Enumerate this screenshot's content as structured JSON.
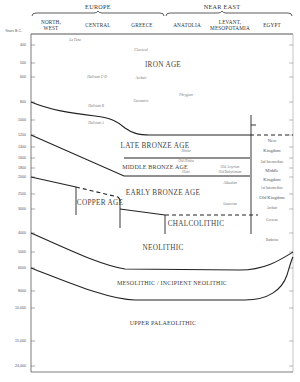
{
  "header": {
    "regions": [
      {
        "label": "EUROPE",
        "x": 98
      },
      {
        "label": "NEAR EAST",
        "x": 222
      }
    ],
    "columns": [
      {
        "label_line1": "NORTH,",
        "label_line2": "WEST",
        "x": 51
      },
      {
        "label_line1": "CENTRAL",
        "label_line2": "",
        "x": 98
      },
      {
        "label_line1": "GREECE",
        "label_line2": "",
        "x": 142
      },
      {
        "label_line1": "ANATOLIA",
        "label_line2": "",
        "x": 187
      },
      {
        "label_line1": "LEVANT,",
        "label_line2": "MESOPOTAMIA",
        "x": 230
      },
      {
        "label_line1": "EGYPT",
        "label_line2": "",
        "x": 272
      }
    ],
    "y_axis_title": "Years B.C."
  },
  "chart_data": {
    "type": "diagram",
    "ylabel": "Years B.C.",
    "y_ticks": [
      {
        "label": "400",
        "y": 45
      },
      {
        "label": "500",
        "y": 63
      },
      {
        "label": "600",
        "y": 77
      },
      {
        "label": "800",
        "y": 102
      },
      {
        "label": "1000",
        "y": 120
      },
      {
        "label": "1200",
        "y": 135
      },
      {
        "label": "1400",
        "y": 147
      },
      {
        "label": "1600",
        "y": 158
      },
      {
        "label": "1800",
        "y": 168
      },
      {
        "label": "2000",
        "y": 177
      },
      {
        "label": "2500",
        "y": 194
      },
      {
        "label": "3000",
        "y": 209
      },
      {
        "label": "4000",
        "y": 233
      },
      {
        "label": "5000",
        "y": 252
      },
      {
        "label": "6000",
        "y": 268
      },
      {
        "label": "8000",
        "y": 291
      },
      {
        "label": "10,000",
        "y": 308
      },
      {
        "label": "15,000",
        "y": 341
      },
      {
        "label": "24,000",
        "y": 366
      }
    ],
    "periods": [
      {
        "label": "IRON AGE",
        "x": 163,
        "y": 67
      },
      {
        "label": "LATE BRONZE AGE",
        "x": 155,
        "y": 148
      },
      {
        "label": "MIDDLE BRONZE AGE",
        "x": 155,
        "y": 169
      },
      {
        "label": "EARLY BRONZE AGE",
        "x": 163,
        "y": 195
      },
      {
        "label": "COPPER AGE",
        "x": 100,
        "y": 205
      },
      {
        "label": "CHALCOLITHIC",
        "x": 196,
        "y": 226
      },
      {
        "label": "NEOLITHIC",
        "x": 163,
        "y": 250
      },
      {
        "label": "MESOLITHIC / INCIPIENT NEOLITHIC",
        "x": 172,
        "y": 285
      },
      {
        "label": "UPPER PALAEOLITHIC",
        "x": 163,
        "y": 325
      }
    ],
    "cultures": [
      {
        "label": "La Tène",
        "x": 75,
        "y": 41
      },
      {
        "label": "Classical",
        "x": 141,
        "y": 51
      },
      {
        "label": "Hallstatt C-D",
        "x": 97,
        "y": 78
      },
      {
        "label": "Archaic",
        "x": 141,
        "y": 79
      },
      {
        "label": "Phrygian",
        "x": 186,
        "y": 96
      },
      {
        "label": "Geometric",
        "x": 141,
        "y": 102
      },
      {
        "label": "Hallstatt B",
        "x": 96,
        "y": 107
      },
      {
        "label": "Hallstatt A",
        "x": 96,
        "y": 124
      },
      {
        "label": "Hittite",
        "x": 186,
        "y": 152
      },
      {
        "label": "Old Hittite",
        "x": 186,
        "y": 162
      },
      {
        "label": "Hatti",
        "x": 186,
        "y": 173
      },
      {
        "label": "Old Assyrian",
        "x": 230,
        "y": 168
      },
      {
        "label": "Old Babylonian",
        "x": 230,
        "y": 173
      },
      {
        "label": "Akkadian",
        "x": 230,
        "y": 184
      },
      {
        "label": "Sumerian",
        "x": 230,
        "y": 205
      }
    ],
    "egypt": [
      {
        "label": "New",
        "y": 142,
        "size": "big"
      },
      {
        "label": "Kingdom",
        "y": 152,
        "size": "big"
      },
      {
        "label": "2nd Intermediate",
        "y": 163,
        "size": "small"
      },
      {
        "label": "Middle",
        "y": 172,
        "size": "big"
      },
      {
        "label": "Kingdom",
        "y": 181,
        "size": "big"
      },
      {
        "label": "1st Intermediate",
        "y": 189,
        "size": "small"
      },
      {
        "label": "Old Kingdom",
        "y": 199,
        "size": "big"
      },
      {
        "label": "Archaic",
        "y": 209,
        "size": "small"
      },
      {
        "label": "Gerzean",
        "y": 221,
        "size": "small"
      },
      {
        "label": "Badarian",
        "y": 241,
        "size": "small"
      }
    ]
  }
}
